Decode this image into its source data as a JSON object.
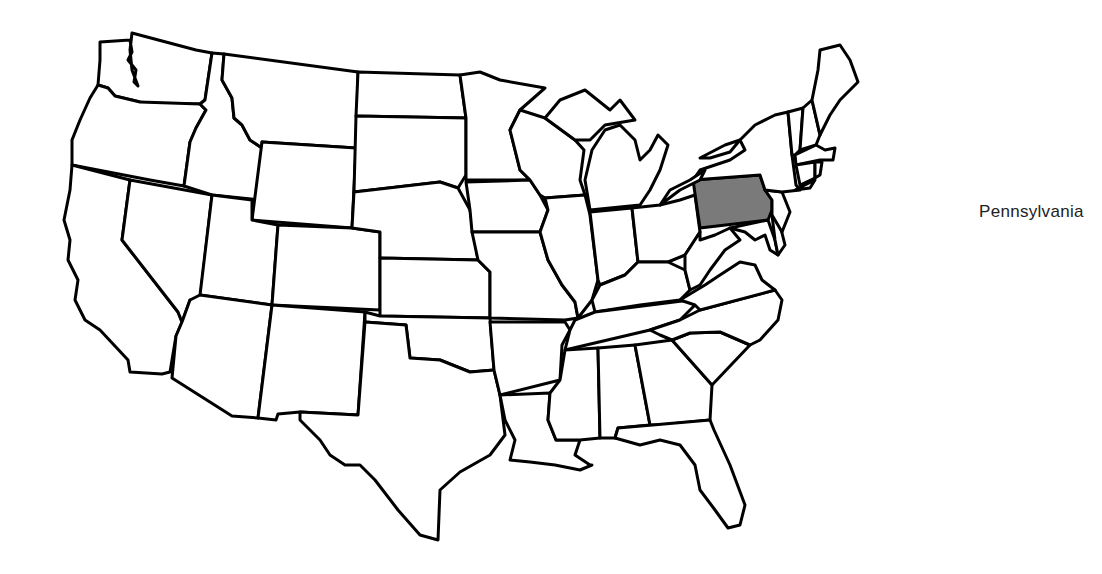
{
  "map": {
    "region": "Contiguous United States",
    "style": "black outline, white fill",
    "highlighted_state": "Pennsylvania",
    "highlight_color": "#7a7a7a",
    "outline_color": "#000000",
    "background_color": "#ffffff"
  },
  "label": {
    "text": "Pennsylvania"
  }
}
